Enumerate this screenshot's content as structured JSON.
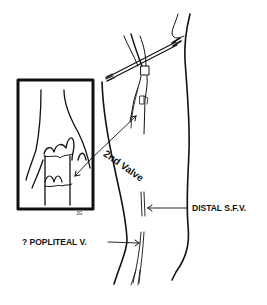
{
  "figure": {
    "inset": {
      "signature": "JG"
    },
    "labels": {
      "valve": "2nd Valve",
      "distal_sfv": "DISTAL S.F.V.",
      "popliteal": "? POPLITEAL V."
    },
    "colors": {
      "ink": "#111111",
      "background": "#ffffff"
    }
  }
}
